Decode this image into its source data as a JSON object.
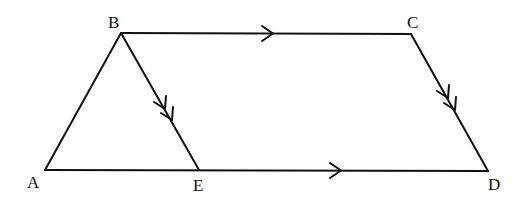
{
  "diagram": {
    "title": "",
    "points": {
      "A": {
        "label": "A",
        "x": 45,
        "y": 170,
        "lx": 27,
        "ly": 188
      },
      "B": {
        "label": "B",
        "x": 121,
        "y": 33,
        "lx": 108,
        "ly": 28
      },
      "C": {
        "label": "C",
        "x": 411,
        "y": 34,
        "lx": 407,
        "ly": 28
      },
      "D": {
        "label": "D",
        "x": 488,
        "y": 171,
        "lx": 488,
        "ly": 190
      },
      "E": {
        "label": "E",
        "x": 199,
        "y": 170,
        "lx": 193,
        "ly": 191
      }
    },
    "segments": [
      {
        "from": "A",
        "to": "B"
      },
      {
        "from": "B",
        "to": "C",
        "arrow": "single"
      },
      {
        "from": "C",
        "to": "D",
        "arrow": "double"
      },
      {
        "from": "A",
        "to": "D",
        "arrow": "single"
      },
      {
        "from": "B",
        "to": "E",
        "arrow": "double"
      }
    ],
    "stroke_color": "#111111"
  }
}
